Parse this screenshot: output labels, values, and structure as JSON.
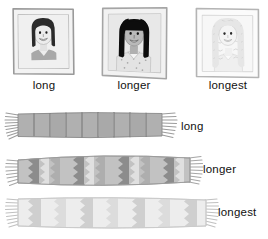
{
  "canvas": {
    "width": 268,
    "height": 239,
    "background": "#ffffff"
  },
  "portraits": {
    "items": [
      {
        "id": "portrait-short-hair",
        "caption": "long",
        "hair_length": "long",
        "hair_color": "#2b2b2b",
        "hair_description": "dark bob, chin length, parted",
        "skin_color": "#ececec",
        "shirt_color": "#a8a8a8",
        "shirt_description": "gray v-neck",
        "frame_outer": "#9a9a9a",
        "frame_inner": "#c9c9c9",
        "photo_bg": "#f0f0f0",
        "tilt_deg": -1.5
      },
      {
        "id": "portrait-medium-hair",
        "caption": "longer",
        "hair_length": "longer",
        "hair_color": "#0d0d0d",
        "hair_description": "black straight hair with bangs, shoulder length",
        "skin_color": "#b9b9b9",
        "shirt_color": "#e3e3e3",
        "shirt_description": "light patterned top with collar",
        "frame_outer": "#a5a5a5",
        "frame_inner": "#d2d2d2",
        "photo_bg": "#e8e8e8",
        "tilt_deg": 1.2
      },
      {
        "id": "portrait-longest-hair",
        "caption": "longest",
        "hair_length": "longest",
        "hair_color": "#e6e6e6",
        "hair_description": "very long pale curly hair past shoulders",
        "skin_color": "#f4f4f4",
        "shirt_color": "#efefef",
        "shirt_description": "pale top",
        "frame_outer": "#b4b4b4",
        "frame_inner": "#dcdcdc",
        "photo_bg": "#f7f7f7",
        "tilt_deg": -1.0
      }
    ]
  },
  "scarves": {
    "items": [
      {
        "id": "scarf-long",
        "label": "long",
        "length_px": 170,
        "body_color": "#b0b0b0",
        "accent_color": "#8f8f8f",
        "pattern": "vertical-blocks",
        "pattern_count": 9,
        "fringe_color": "#9c9c9c"
      },
      {
        "id": "scarf-longer",
        "label": "longer",
        "length_px": 192,
        "body_color": "#c2c2c2",
        "accent_color": "#8c8c8c",
        "pattern": "zigzag-chevron",
        "pattern_count": 8,
        "fringe_color": "#a6a6a6"
      },
      {
        "id": "scarf-longest",
        "label": "longest",
        "length_px": 207,
        "body_color": "#e2e2e2",
        "accent_color": "#c5c5c5",
        "pattern": "zigzag-chevron",
        "pattern_count": 7,
        "fringe_color": "#c0c0c0"
      }
    ]
  }
}
